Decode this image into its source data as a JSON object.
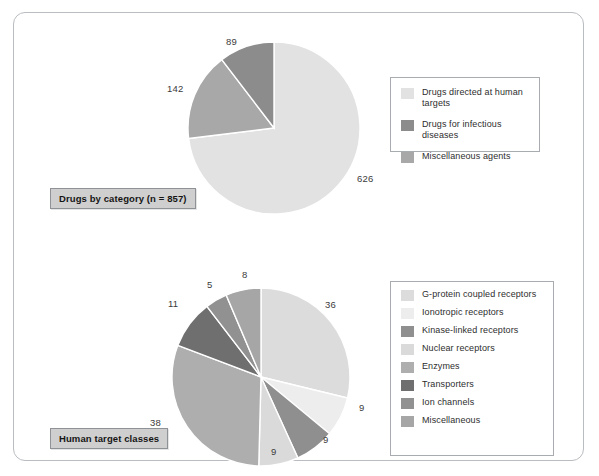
{
  "figure": {
    "border_color": "#b9bcc0",
    "background": "#ffffff"
  },
  "panels": [
    {
      "id": "drugs-by-category",
      "caption": "Drugs by category (n = 857)",
      "legend": {
        "items": [
          {
            "label": "Drugs directed at human targets",
            "color": "#e2e2e2",
            "swatch_name": "legend-swatch-human-targets"
          },
          {
            "label": "Drugs for infectious diseases",
            "color": "#8c8c8c",
            "swatch_name": "legend-swatch-infectious-diseases"
          },
          {
            "label": "Miscellaneous agents",
            "color": "#a8a8a8",
            "swatch_name": "legend-swatch-misc-agents"
          }
        ]
      }
    },
    {
      "id": "human-target-classes",
      "caption": "Human target classes",
      "legend": {
        "items": [
          {
            "label": "G-protein coupled receptors",
            "color": "#dcdcdc",
            "swatch_name": "legend-swatch-gpcr"
          },
          {
            "label": "Ionotropic receptors",
            "color": "#ededed",
            "swatch_name": "legend-swatch-ionotropic"
          },
          {
            "label": "Kinase-linked receptors",
            "color": "#8f8f8f",
            "swatch_name": "legend-swatch-kinase"
          },
          {
            "label": "Nuclear receptors",
            "color": "#dadada",
            "swatch_name": "legend-swatch-nuclear"
          },
          {
            "label": "Enzymes",
            "color": "#aeaeae",
            "swatch_name": "legend-swatch-enzymes"
          },
          {
            "label": "Transporters",
            "color": "#6f6f6f",
            "swatch_name": "legend-swatch-transporters"
          },
          {
            "label": "Ion channels",
            "color": "#919191",
            "swatch_name": "legend-swatch-ion-channels"
          },
          {
            "label": "Miscellaneous",
            "color": "#a6a6a6",
            "swatch_name": "legend-swatch-miscellaneous"
          }
        ]
      }
    }
  ],
  "chart_data": [
    {
      "type": "pie",
      "title": "Drugs by category (n = 857)",
      "total": 857,
      "start_angle_deg": 0,
      "direction": "clockwise",
      "legend_position": "right",
      "slice_separator_color": "#ffffff",
      "labels": [
        "Drugs directed at human targets",
        "Drugs for infectious diseases",
        "Miscellaneous agents"
      ],
      "values": [
        626,
        89,
        142
      ],
      "colors": [
        "#e2e2e2",
        "#8c8c8c",
        "#a8a8a8"
      ],
      "slices": [
        {
          "label": "Drugs directed at human targets",
          "value": 626,
          "color": "#e2e2e2",
          "display": "626"
        },
        {
          "label": "Miscellaneous agents",
          "value": 142,
          "color": "#a8a8a8",
          "display": "142"
        },
        {
          "label": "Drugs for infectious diseases",
          "value": 89,
          "color": "#8c8c8c",
          "display": "89"
        }
      ]
    },
    {
      "type": "pie",
      "title": "Human target classes",
      "total": 125,
      "start_angle_deg": 0,
      "direction": "clockwise",
      "legend_position": "right",
      "slice_separator_color": "#ffffff",
      "labels": [
        "G-protein coupled receptors",
        "Ionotropic receptors",
        "Kinase-linked receptors",
        "Nuclear receptors",
        "Enzymes",
        "Transporters",
        "Ion channels",
        "Miscellaneous"
      ],
      "values": [
        36,
        9,
        9,
        9,
        38,
        11,
        5,
        8
      ],
      "colors": [
        "#dcdcdc",
        "#ededed",
        "#8f8f8f",
        "#dadada",
        "#aeaeae",
        "#6f6f6f",
        "#919191",
        "#a6a6a6"
      ],
      "slices": [
        {
          "label": "G-protein coupled receptors",
          "value": 36,
          "color": "#dcdcdc",
          "display": "36"
        },
        {
          "label": "Ionotropic receptors",
          "value": 9,
          "color": "#ededed",
          "display": "9"
        },
        {
          "label": "Kinase-linked receptors",
          "value": 9,
          "color": "#8f8f8f",
          "display": "9"
        },
        {
          "label": "Nuclear receptors",
          "value": 9,
          "color": "#dadada",
          "display": "9"
        },
        {
          "label": "Enzymes",
          "value": 38,
          "color": "#aeaeae",
          "display": "38"
        },
        {
          "label": "Transporters",
          "value": 11,
          "color": "#6f6f6f",
          "display": "11"
        },
        {
          "label": "Ion channels",
          "value": 5,
          "color": "#919191",
          "display": "5"
        },
        {
          "label": "Miscellaneous",
          "value": 8,
          "color": "#a6a6a6",
          "display": "8"
        }
      ]
    }
  ]
}
